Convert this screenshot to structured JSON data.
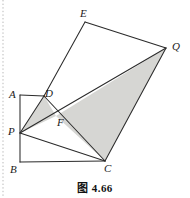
{
  "figure": {
    "caption": "图 4.66",
    "background_color": "#ffffff",
    "stroke_color": "#2b2b2b",
    "shade_color": "#d6d6d3",
    "margin_rule_color": "#b9b9b9",
    "labels": [
      {
        "id": "A",
        "text": "A",
        "x": 9,
        "y": 89
      },
      {
        "id": "B",
        "text": "B",
        "x": 10,
        "y": 164
      },
      {
        "id": "C",
        "text": "C",
        "x": 104,
        "y": 163
      },
      {
        "id": "D",
        "text": "D",
        "x": 45,
        "y": 88
      },
      {
        "id": "E",
        "text": "E",
        "x": 80,
        "y": 8
      },
      {
        "id": "F",
        "text": "F",
        "x": 57,
        "y": 117
      },
      {
        "id": "P",
        "text": "P",
        "x": 8,
        "y": 126
      },
      {
        "id": "Q",
        "text": "Q",
        "x": 172,
        "y": 41
      }
    ],
    "points": {
      "A": {
        "x": 20,
        "y": 95
      },
      "B": {
        "x": 20,
        "y": 162
      },
      "C": {
        "x": 105,
        "y": 161
      },
      "D": {
        "x": 44,
        "y": 96
      },
      "E": {
        "x": 85,
        "y": 22
      },
      "F": {
        "x": 56,
        "y": 116
      },
      "P": {
        "x": 20,
        "y": 133
      },
      "Q": {
        "x": 166,
        "y": 48
      },
      "R": {
        "x": 105,
        "y": 95
      }
    },
    "shaded_regions": [
      {
        "name": "triangle-PDF",
        "vertices": [
          "P",
          "D",
          "F"
        ]
      },
      {
        "name": "triangle-FQC",
        "vertices": [
          "F",
          "Q",
          "C"
        ]
      }
    ],
    "segments": [
      {
        "name": "segment-AB",
        "from": "A",
        "to": "B"
      },
      {
        "name": "segment-BC",
        "from": "B",
        "to": "C"
      },
      {
        "name": "segment-AD",
        "from": "A",
        "to": "D"
      },
      {
        "name": "segment-DE",
        "from": "D",
        "to": "E"
      },
      {
        "name": "segment-EQ",
        "from": "E",
        "to": "Q"
      },
      {
        "name": "segment-QC",
        "from": "Q",
        "to": "C"
      },
      {
        "name": "segment-CD",
        "from": "C",
        "to": "D"
      },
      {
        "name": "segment-PD",
        "from": "P",
        "to": "D"
      },
      {
        "name": "segment-PQ",
        "from": "P",
        "to": "Q"
      },
      {
        "name": "segment-PC",
        "from": "P",
        "to": "C"
      },
      {
        "name": "segment-FC",
        "from": "F",
        "to": "C"
      }
    ],
    "margin_rule": {
      "x": 3,
      "y1": 0,
      "y2": 198
    }
  }
}
